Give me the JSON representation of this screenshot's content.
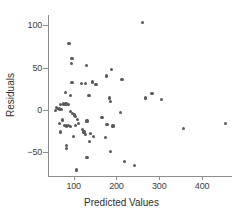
{
  "chart_data": {
    "type": "scatter",
    "title": "",
    "xlabel": "Predicted Values",
    "ylabel": "Residuals",
    "xlim": [
      40,
      470
    ],
    "ylim": [
      -78,
      112
    ],
    "xticks": [
      100,
      200,
      300,
      400
    ],
    "xtick_labels": [
      "100",
      "200",
      "300",
      "400"
    ],
    "yticks": [
      -50,
      0,
      50,
      100
    ],
    "ytick_labels": [
      "−50",
      "0",
      "50",
      "100"
    ],
    "grid": false,
    "legend": null,
    "marker": {
      "shape": "circle",
      "color": "#595959",
      "size_px": 3.2
    },
    "axis_color": "#8d8d8d",
    "points": [
      {
        "x": 260,
        "y": 103
      },
      {
        "x": 89,
        "y": 78
      },
      {
        "x": 96,
        "y": 61
      },
      {
        "x": 94,
        "y": 55
      },
      {
        "x": 130,
        "y": 52
      },
      {
        "x": 188,
        "y": 48
      },
      {
        "x": 177,
        "y": 40
      },
      {
        "x": 213,
        "y": 36
      },
      {
        "x": 96,
        "y": 32
      },
      {
        "x": 119,
        "y": 31
      },
      {
        "x": 128,
        "y": 31
      },
      {
        "x": 144,
        "y": 33
      },
      {
        "x": 152,
        "y": 30
      },
      {
        "x": 80,
        "y": 21
      },
      {
        "x": 93,
        "y": 17
      },
      {
        "x": 136,
        "y": 17
      },
      {
        "x": 283,
        "y": 19
      },
      {
        "x": 268,
        "y": 14
      },
      {
        "x": 306,
        "y": 12
      },
      {
        "x": 183,
        "y": 14
      },
      {
        "x": 186,
        "y": 10
      },
      {
        "x": 69,
        "y": 6
      },
      {
        "x": 76,
        "y": 7
      },
      {
        "x": 82,
        "y": 7
      },
      {
        "x": 87,
        "y": 6
      },
      {
        "x": 60,
        "y": 3
      },
      {
        "x": 63,
        "y": 2
      },
      {
        "x": 66,
        "y": 1
      },
      {
        "x": 71,
        "y": 0
      },
      {
        "x": 57,
        "y": -1
      },
      {
        "x": 92,
        "y": -2
      },
      {
        "x": 97,
        "y": -4
      },
      {
        "x": 101,
        "y": -6
      },
      {
        "x": 104,
        "y": -8
      },
      {
        "x": 109,
        "y": -11
      },
      {
        "x": 210,
        "y": -3
      },
      {
        "x": 166,
        "y": -9
      },
      {
        "x": 131,
        "y": -13
      },
      {
        "x": 74,
        "y": -12
      },
      {
        "x": 66,
        "y": -16
      },
      {
        "x": 78,
        "y": -18
      },
      {
        "x": 84,
        "y": -19
      },
      {
        "x": 88,
        "y": -18
      },
      {
        "x": 93,
        "y": -20
      },
      {
        "x": 104,
        "y": -18
      },
      {
        "x": 112,
        "y": -16
      },
      {
        "x": 178,
        "y": -17
      },
      {
        "x": 192,
        "y": -19
      },
      {
        "x": 356,
        "y": -22
      },
      {
        "x": 455,
        "y": -16
      },
      {
        "x": 121,
        "y": -23
      },
      {
        "x": 124,
        "y": -26
      },
      {
        "x": 127,
        "y": -29
      },
      {
        "x": 140,
        "y": -28
      },
      {
        "x": 70,
        "y": -26
      },
      {
        "x": 99,
        "y": -31
      },
      {
        "x": 146,
        "y": -31
      },
      {
        "x": 174,
        "y": -33
      },
      {
        "x": 137,
        "y": -37
      },
      {
        "x": 84,
        "y": -42
      },
      {
        "x": 84,
        "y": -46
      },
      {
        "x": 131,
        "y": -56
      },
      {
        "x": 187,
        "y": -49
      },
      {
        "x": 219,
        "y": -61
      },
      {
        "x": 243,
        "y": -66
      },
      {
        "x": 107,
        "y": -71
      }
    ]
  }
}
